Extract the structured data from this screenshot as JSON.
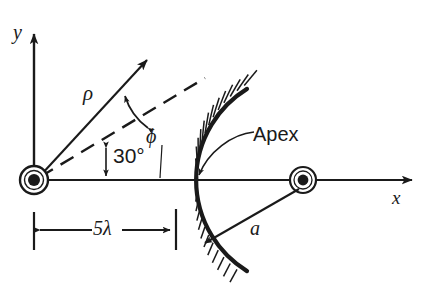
{
  "figure": {
    "background_color": "#ffffff",
    "ink_color": "#1a1a1a"
  },
  "axes": {
    "y_label": "y",
    "x_label": "x",
    "origin_marker_name": "line-source-symbol"
  },
  "labels": {
    "rho": "ρ",
    "phi": "ϕ",
    "angle_30": "30°",
    "apex": "Apex",
    "radius_a": "a",
    "distance_5lambda": "5λ"
  },
  "geometry": {
    "origin_x": 34,
    "origin_y": 180,
    "apex_x": 196,
    "center_of_curvature_x": 303,
    "arc_radius": 107,
    "rho_angle_deg": 37,
    "dashed_angle_deg": 30,
    "focal_distance_label": "5λ"
  }
}
